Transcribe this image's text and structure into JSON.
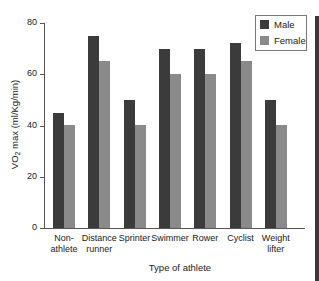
{
  "chart_data": {
    "type": "bar",
    "title": "",
    "xlabel": "Type of athlete",
    "ylabel": "VO2 max (ml/Kg/min)",
    "ylim": [
      0,
      80
    ],
    "yticks": [
      0,
      20,
      40,
      60,
      80
    ],
    "grid": false,
    "legend_position": "top-right",
    "categories": [
      "Non-athlete",
      "Distance runner",
      "Sprinter",
      "Swimmer",
      "Rower",
      "Cyclist",
      "Weight lifter"
    ],
    "category_labels": [
      [
        "Non-",
        "athlete"
      ],
      [
        "Distance",
        "runner"
      ],
      [
        "Sprinter",
        ""
      ],
      [
        "Swimmer",
        ""
      ],
      [
        "Rower",
        ""
      ],
      [
        "Cyclist",
        ""
      ],
      [
        "Weight",
        "lifter"
      ]
    ],
    "series": [
      {
        "name": "Male",
        "color": "#3b3b3b",
        "values": [
          45,
          75,
          50,
          70,
          70,
          72,
          50
        ]
      },
      {
        "name": "Female",
        "color": "#8a8a8a",
        "values": [
          40,
          65,
          40,
          60,
          60,
          65,
          40
        ]
      }
    ]
  },
  "labels": {
    "ylabel_prefix": "VO",
    "ylabel_sub": "2",
    "ylabel_suffix": " max (ml/Kg/min)"
  }
}
